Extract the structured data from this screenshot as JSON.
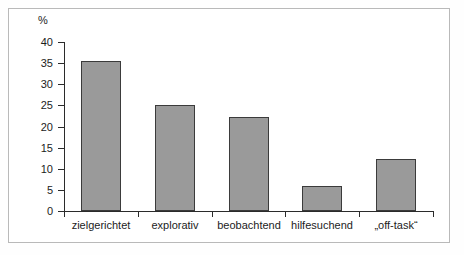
{
  "chart_data": {
    "type": "bar",
    "title": "",
    "xlabel": "",
    "ylabel": "%",
    "ylim": [
      0,
      40
    ],
    "ytick_step": 5,
    "grid": false,
    "legend": false,
    "bar_color": "#9a9a9a",
    "bar_border_color": "#3b3b3b",
    "axis_color": "#2b2b2b",
    "categories": [
      "zielgerichtet",
      "explorativ",
      "beobachtend",
      "hilfesuchend",
      "„off-task“"
    ],
    "values": [
      35.5,
      25.2,
      22.2,
      6.0,
      12.4
    ],
    "ytick_labels": [
      "40",
      "35",
      "30",
      "25",
      "20",
      "15",
      "10",
      "5",
      "0"
    ],
    "ytick_values": [
      40,
      35,
      30,
      25,
      20,
      15,
      10,
      5,
      0
    ]
  }
}
